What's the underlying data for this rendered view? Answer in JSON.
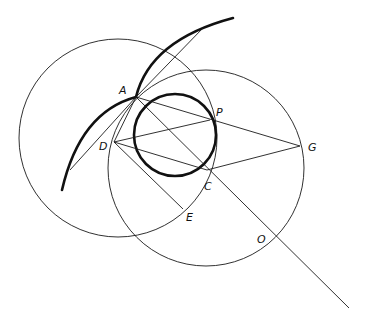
{
  "diagram": {
    "type": "geometric-construction",
    "labels": {
      "A": "A",
      "P": "P",
      "D": "D",
      "G": "G",
      "C": "C",
      "E": "E",
      "O": "O"
    },
    "points": {
      "A": [
        136,
        97
      ],
      "P": [
        210,
        120
      ],
      "D": [
        114,
        142
      ],
      "G": [
        300,
        146
      ],
      "C": [
        207,
        170
      ],
      "E": [
        183,
        209
      ],
      "O": [
        276,
        236
      ]
    },
    "circles": [
      {
        "name": "left-circle",
        "cx": 118,
        "cy": 138,
        "r": 99,
        "weight": "thin"
      },
      {
        "name": "right-circle",
        "cx": 206,
        "cy": 168,
        "r": 98,
        "weight": "thin"
      },
      {
        "name": "inner-circle",
        "cx": 175,
        "cy": 135,
        "r": 41,
        "weight": "thick"
      }
    ],
    "colors": {
      "stroke": "#111111",
      "background": "#ffffff"
    }
  }
}
